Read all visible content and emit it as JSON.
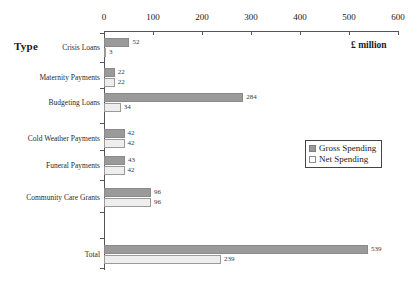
{
  "chart_data": {
    "type": "bar",
    "orientation": "horizontal",
    "title": "",
    "xlabel": "£ million",
    "ylabel": "Type",
    "xlim": [
      0,
      600
    ],
    "xticks": [
      0,
      100,
      200,
      300,
      400,
      500,
      600
    ],
    "xtick_labels": [
      "0",
      "100",
      "200",
      "300",
      "400",
      "500",
      "600"
    ],
    "grid": false,
    "legend_position": "right-middle",
    "categories": [
      "Crisis Loans",
      "Maternity Payments",
      "Budgeting Loans",
      "Cold Weather Payments",
      "Funeral Payments",
      "Community Care Grants",
      "Total"
    ],
    "series": [
      {
        "name": "Gross Spending",
        "color": "#9a9a9a",
        "values": [
          52,
          22,
          284,
          42,
          43,
          96,
          539
        ]
      },
      {
        "name": "Net Spending",
        "color": "#eeeeee",
        "values": [
          3,
          22,
          34,
          42,
          42,
          96,
          239
        ]
      }
    ]
  },
  "axis": {
    "y_title": "Type",
    "unit_label": "£ million"
  },
  "legend": {
    "items": [
      {
        "label": "Gross Spending",
        "swatch": "gross"
      },
      {
        "label": "Net Spending",
        "swatch": "net"
      }
    ]
  }
}
